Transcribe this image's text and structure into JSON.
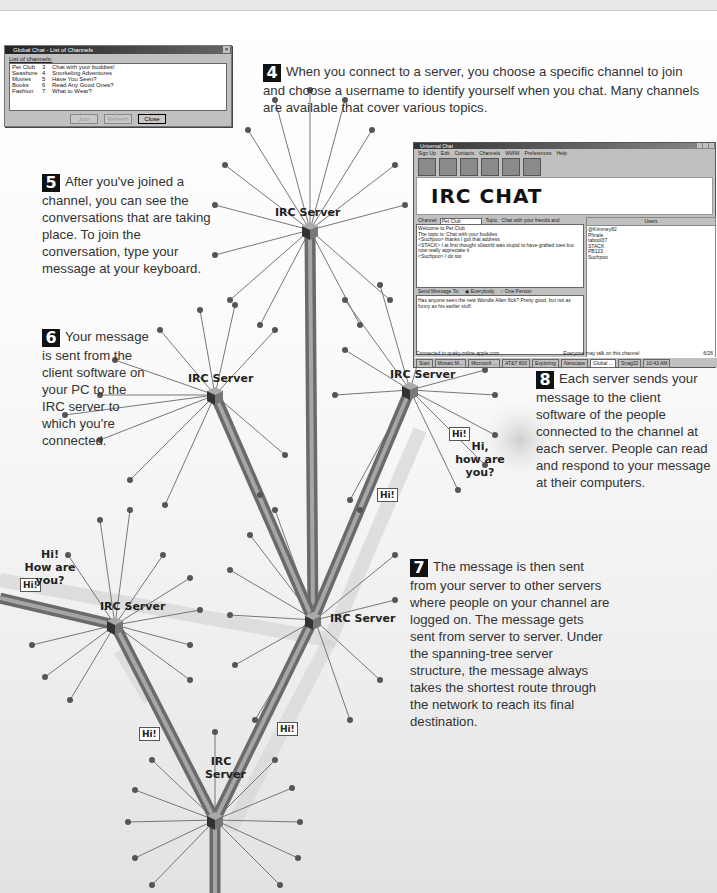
{
  "dialog": {
    "title": "Global Chat - List of Channels",
    "close_glyph": "×",
    "caption": "List of channels:",
    "channels": [
      {
        "name": "Pet Club",
        "users": "3",
        "topic": "Chat with your buddies!"
      },
      {
        "name": "Seashore",
        "users": "4",
        "topic": "Snorkeling Adventures"
      },
      {
        "name": "Movies",
        "users": "5",
        "topic": "Have You Seen?"
      },
      {
        "name": "Books",
        "users": "6",
        "topic": "Read Any Good Ones?"
      },
      {
        "name": "Fashion",
        "users": "7",
        "topic": "What to Wear?"
      }
    ],
    "buttons": {
      "join": "Join",
      "refresh": "Refresh",
      "close": "Close"
    }
  },
  "app": {
    "title": "Universal Chat",
    "menu": [
      "Sign Up",
      "Edit",
      "Contacts",
      "Channels",
      "WWW",
      "Preferences",
      "Help"
    ],
    "banner": "IRC CHAT",
    "channel_label": "Channel",
    "channel_value": "Pet Club",
    "topic_label": "Topic:",
    "topic_value": "Chat with your friends and neighbors!",
    "chat_lines": [
      "Welcome to Pet Club",
      "The topic is: Chat with your buddies",
      "<Suchpoo> thanks I got that address",
      "<STACK> I at first thought s0world was stupid to have grafted toes but now really appreciate it",
      "<Suchpoo> I do too"
    ],
    "send_label": "Send Message To:",
    "send_everybody": "Everybody",
    "send_one": "One Person",
    "message_text": "Has anyone seen the new Wondle Allen flick? Pretty good, but not as funny as his earlier stuff.",
    "users_header": "Users",
    "users": [
      "@Kimmey82",
      "Pfinale",
      "tabool37",
      "STACK",
      "PB123",
      "Suchpoo"
    ],
    "status_left": "Connected to quaky.online.apple.com",
    "status_right": "Everyone may talk on this channel",
    "status_count": "6/26",
    "taskbar": [
      "Start",
      "Mosaic M...",
      "Microsoft ...",
      "AT&T 800",
      "Exploring",
      "Netscape",
      "Global ...",
      "Snag32"
    ],
    "clock": "10:43 AM"
  },
  "steps": {
    "s4": {
      "num": "4",
      "text": "When you connect to a server, you choose a specific channel to join and choose a username to identify yourself when you chat. Many channels are available that cover various topics."
    },
    "s5": {
      "num": "5",
      "text": "After you've joined a channel, you can see the conversations that are taking place. To join the conversation, type your message at your keyboard."
    },
    "s6": {
      "num": "6",
      "text": "Your message is sent from the client software on your PC to the IRC server to which you're connected."
    },
    "s7": {
      "num": "7",
      "text": "The message is then sent from your server to other servers where people on your channel are logged on. The message gets sent from server to server. Under the spanning-tree server structure, the message always takes the shortest route through the network to reach its final destination."
    },
    "s8": {
      "num": "8",
      "text": "Each server sends your message to the client software of the people connected to the channel at each server. People can read and respond to your message at their computers."
    }
  },
  "diagram": {
    "server_label": "IRC Server",
    "bottom_server_label_1": "IRC",
    "bottom_server_label_2": "Server",
    "hi_tag": "Hi!",
    "bubble_left_1": "Hi!",
    "bubble_left_2": "How are you?",
    "bubble_right_1": "Hi,",
    "bubble_right_2": "how are you?"
  }
}
